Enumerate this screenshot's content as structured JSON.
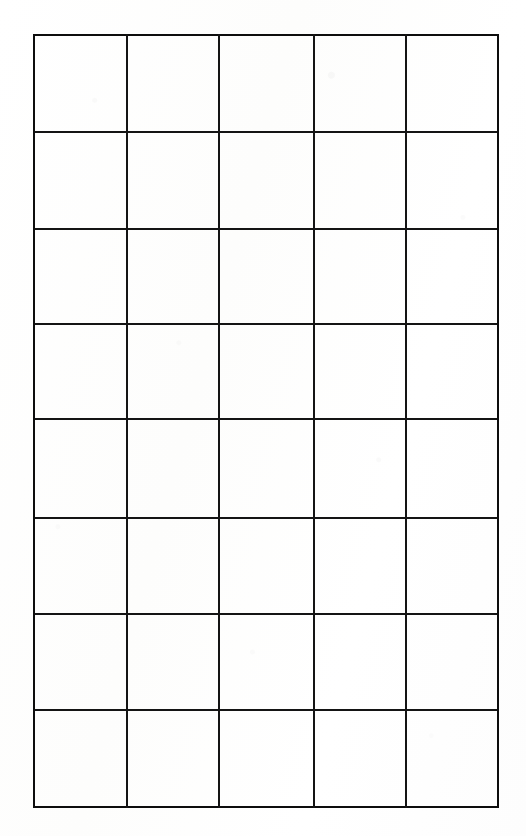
{
  "document": {
    "kind": "blank-ruled-grid-sheet",
    "page_background_color": "#fefefe",
    "rule_color": "#141414",
    "rule_width_px": 2,
    "cell_text": ""
  },
  "grid": {
    "columns": 5,
    "rows": 8,
    "cells_total": 40,
    "filled_cells": 0,
    "bounds": {
      "left": 33,
      "top": 34,
      "right": 497,
      "bottom": 806
    },
    "column_edges_x": [
      33,
      126,
      218,
      313,
      405,
      497
    ],
    "row_edges_y": [
      34,
      131,
      228,
      323,
      418,
      517,
      613,
      709,
      806
    ],
    "column_widths": [
      93,
      92,
      95,
      92,
      92
    ],
    "row_heights": [
      97,
      97,
      95,
      95,
      99,
      96,
      96,
      97
    ],
    "column_headers": [
      "",
      "",
      "",
      "",
      ""
    ],
    "rows_data": [
      [
        "",
        "",
        "",
        "",
        ""
      ],
      [
        "",
        "",
        "",
        "",
        ""
      ],
      [
        "",
        "",
        "",
        "",
        ""
      ],
      [
        "",
        "",
        "",
        "",
        ""
      ],
      [
        "",
        "",
        "",
        "",
        ""
      ],
      [
        "",
        "",
        "",
        "",
        ""
      ],
      [
        "",
        "",
        "",
        "",
        ""
      ],
      [
        "",
        "",
        "",
        "",
        ""
      ]
    ]
  }
}
